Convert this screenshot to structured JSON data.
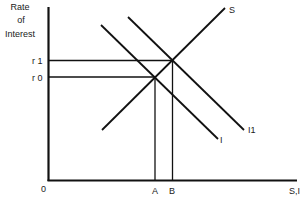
{
  "diagram": {
    "type": "loanable-funds-savings-investment",
    "y_axis_label": [
      "Rate",
      "of",
      "Interest"
    ],
    "x_axis_label": "S,I",
    "origin_label": "0",
    "rate_levels": [
      {
        "label": "r 1",
        "y": 60
      },
      {
        "label": "r 0",
        "y": 76
      }
    ],
    "quantity_levels": [
      {
        "label": "A",
        "x": 155
      },
      {
        "label": "B",
        "x": 172
      }
    ],
    "curves": [
      {
        "name": "S",
        "label": "S",
        "x1": 102,
        "y1": 130,
        "x2": 225,
        "y2": 8
      },
      {
        "name": "I",
        "label": "I",
        "x1": 101,
        "y1": 25,
        "x2": 218,
        "y2": 139
      },
      {
        "name": "I1",
        "label": "I1",
        "x1": 128,
        "y1": 17,
        "x2": 244,
        "y2": 130
      }
    ],
    "colors": {
      "line": "#111111",
      "background": "#ffffff"
    }
  }
}
